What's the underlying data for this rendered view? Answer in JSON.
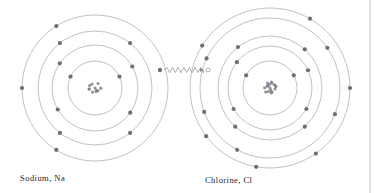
{
  "diagram": {
    "type": "bohr-atom-electron-transfer",
    "background_color": "#ffffff",
    "shell_stroke_color": "#8e8e96",
    "electron_color": "#6e6e78",
    "nucleus_color": "#7a7a86",
    "transfer_line_color": "#8a8a93",
    "border_line_color": "#b9b9bf",
    "label_color": "#1d1d1d"
  },
  "atoms": [
    {
      "id": "sodium",
      "label": "Sodium, Na",
      "symbol": "Na",
      "name": "Sodium",
      "center": {
        "x": 95,
        "y": 88
      },
      "nucleus_radius": 6.5,
      "nucleus_particle_count": 11,
      "electron_radius": 2.1,
      "shells": [
        {
          "index": 1,
          "radius": 27,
          "electron_count": 2,
          "electron_angles": [
            205,
            335
          ]
        },
        {
          "index": 2,
          "radius": 43,
          "electron_count": 4,
          "electron_angles": [
            150,
            35,
            215,
            330
          ]
        },
        {
          "index": 3,
          "radius": 57,
          "electron_count": 4,
          "electron_angles": [
            128,
            52,
            232,
            308
          ]
        },
        {
          "index": 4,
          "radius": 73,
          "electron_count": 3,
          "electron_angles": [
            180,
            122,
            238
          ]
        }
      ],
      "valence_electron": {
        "x": 160,
        "y": 70
      }
    },
    {
      "id": "chlorine",
      "label": "Chlorine, Cl",
      "symbol": "Cl",
      "name": "Chlorine",
      "center": {
        "x": 270,
        "y": 88
      },
      "nucleus_radius": 6.8,
      "nucleus_particle_count": 17,
      "electron_radius": 2.1,
      "shells": [
        {
          "index": 1,
          "radius": 27,
          "electron_count": 2,
          "electron_angles": [
            208,
            332
          ]
        },
        {
          "index": 2,
          "radius": 42,
          "electron_count": 4,
          "electron_angles": [
            150,
            30,
            218,
            335
          ]
        },
        {
          "index": 3,
          "radius": 52,
          "electron_count": 4,
          "electron_angles": [
            132,
            48,
            232,
            312
          ]
        },
        {
          "index": 4,
          "radius": 70,
          "electron_count": 5,
          "electron_angles": [
            160,
            118,
            22,
            205,
            325
          ]
        },
        {
          "index": 5,
          "radius": 80,
          "electron_count": 6,
          "electron_angles": [
            143,
            100,
            55,
            0,
            212,
            300
          ]
        }
      ],
      "vacancy": {
        "x": 208,
        "y": 70
      }
    }
  ],
  "electron_transfer": {
    "label": "electron transfer",
    "from_atom": "sodium",
    "to_atom": "chlorine",
    "start": {
      "x": 161,
      "y": 70
    },
    "end": {
      "x": 207,
      "y": 70
    },
    "style": "zigzag-arrow",
    "zigzag_amplitude": 2.6,
    "zigzag_cycles": 7,
    "arrowhead": true,
    "source_marker": "filled-dot",
    "target_marker": "open-circle"
  },
  "page_border": {
    "right_rule_x": 370,
    "visible": true
  }
}
